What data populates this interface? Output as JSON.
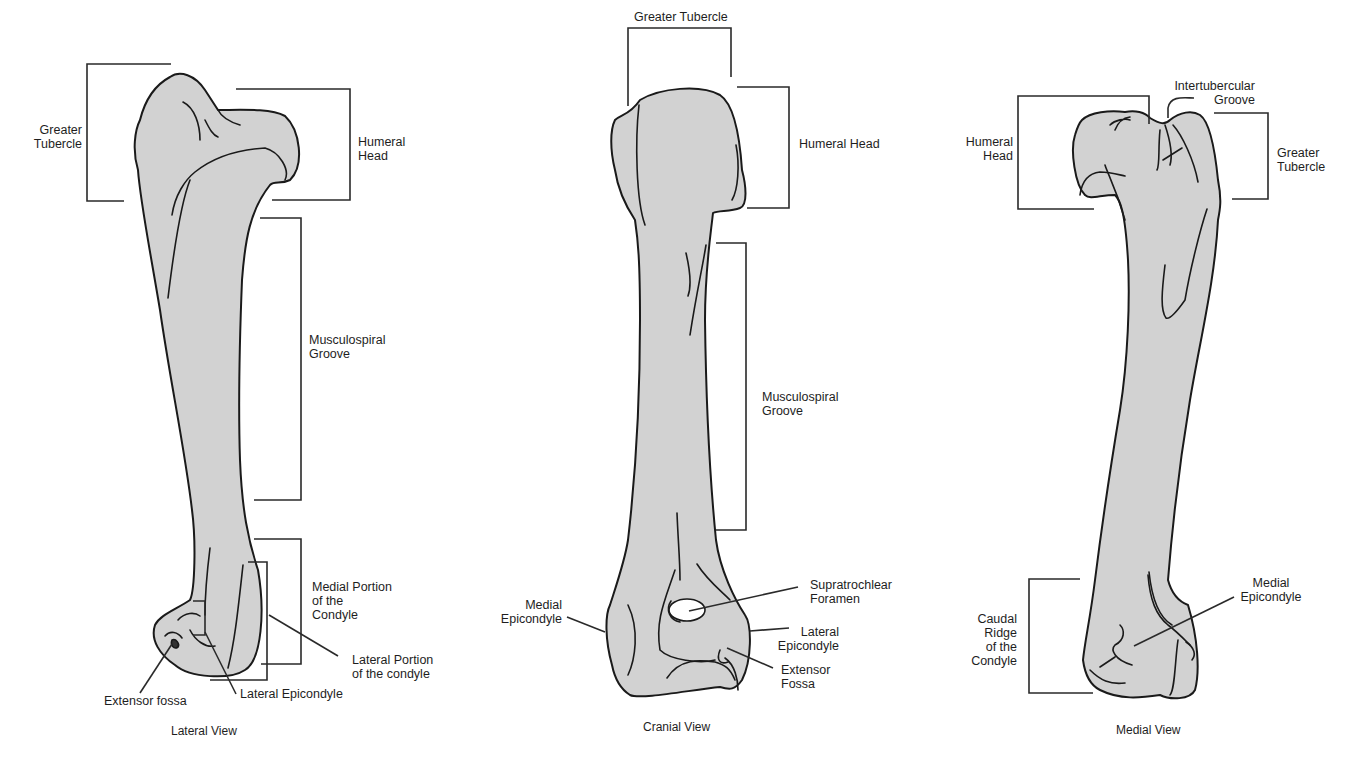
{
  "figure": {
    "fill_color": "#d2d2d2",
    "outline_color": "#1a1a1a",
    "views": [
      {
        "title": "Lateral View",
        "labels": [
          "Greater\nTubercle",
          "Humeral\nHead",
          "Musculospiral\nGroove",
          "Medial Portion\nof the\nCondyle",
          "Lateral Portion\nof the condyle",
          "Extensor fossa",
          "Lateral Epicondyle"
        ]
      },
      {
        "title": "Cranial View",
        "labels": [
          "Greater Tubercle",
          "Humeral Head",
          "Musculospiral\nGroove",
          "Supratrochlear\nForamen",
          "Medial\nEpicondyle",
          "Lateral\nEpicondyle",
          "Extensor\nFossa"
        ]
      },
      {
        "title": "Medial View",
        "labels": [
          "Humeral\nHead",
          "Intertubercular\nGroove",
          "Greater\nTubercle",
          "Medial\nEpicondyle",
          "Caudal\nRidge\nof the\nCondyle"
        ]
      }
    ]
  }
}
